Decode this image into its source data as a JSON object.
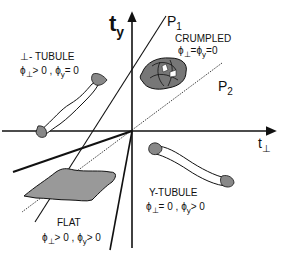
{
  "axes": {
    "y_axis": {
      "symbol": "t",
      "subscript": "y"
    },
    "x_axis": {
      "symbol": "t",
      "subscript": "⊥"
    }
  },
  "lines": [
    {
      "label": "P",
      "subscript": "1"
    },
    {
      "label": "P",
      "subscript": "2"
    }
  ],
  "phases": [
    {
      "name": "CRUMPLED",
      "condition": "ϕ⊥ = ϕy = 0",
      "phi_perp": "ϕ",
      "phi_perp_sub": "⊥",
      "eq1": "=",
      "phi_y": "ϕ",
      "phi_y_sub": "y",
      "eq2": "=0"
    },
    {
      "name": "⊥- TUBULE",
      "condition": "ϕ⊥ > 0, ϕy = 0",
      "phi_perp": "ϕ",
      "phi_perp_sub": "⊥",
      "eq1": "> 0 ,",
      "phi_y": "ϕ",
      "phi_y_sub": "y",
      "eq2": "= 0"
    },
    {
      "name": "Y-TUBULE",
      "condition": "ϕ⊥ = 0, ϕy > 0",
      "phi_perp": "ϕ",
      "phi_perp_sub": "⊥",
      "eq1": "= 0 ,",
      "phi_y": "ϕ",
      "phi_y_sub": "y",
      "eq2": "> 0"
    },
    {
      "name": "FLAT",
      "condition": "ϕ⊥ > 0, ϕy > 0",
      "phi_perp": "ϕ",
      "phi_perp_sub": "⊥",
      "eq1": "> 0 ,",
      "phi_y": "ϕ",
      "phi_y_sub": "y",
      "eq2": "> 0"
    }
  ]
}
